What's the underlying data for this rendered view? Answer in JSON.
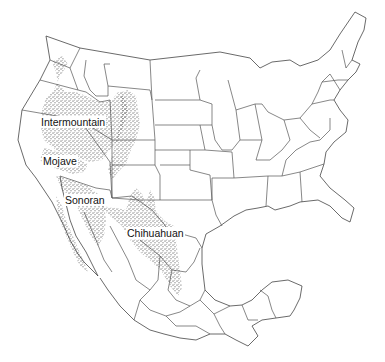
{
  "map": {
    "title": "North American Deserts",
    "background": "#ffffff",
    "line_color": "#555555",
    "stipple_color": "#222222",
    "regions": [
      {
        "id": "intermountain",
        "label": "Intermountain",
        "x": 40,
        "y": 116
      },
      {
        "id": "mojave",
        "label": "Mojave",
        "x": 42,
        "y": 155
      },
      {
        "id": "sonoran",
        "label": "Sonoran",
        "x": 64,
        "y": 194
      },
      {
        "id": "chihuahuan",
        "label": "Chihuahuan",
        "x": 126,
        "y": 227
      }
    ]
  }
}
